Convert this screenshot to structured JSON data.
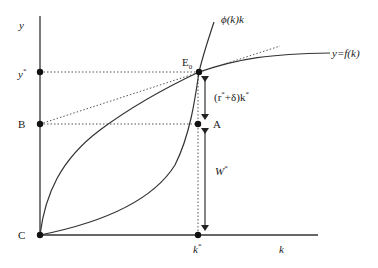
{
  "figure": {
    "type": "economics-diagram",
    "axes": {
      "y_label": "y",
      "x_label": "k"
    },
    "curves": [
      {
        "name": "production-function",
        "label": "y=f(k)"
      },
      {
        "name": "phi-curve",
        "label": "ϕ(k)k"
      },
      {
        "name": "tangent-line",
        "style": "dotted"
      }
    ],
    "points": {
      "origin": "C",
      "b": "B",
      "y_star": "y",
      "y_star_sup": "*",
      "e0": "E",
      "e0_sub": "0",
      "a": "A",
      "k_star": "k",
      "k_star_sup": "*"
    },
    "annotations": {
      "depreciation_prefix": "(r",
      "depreciation_sup1": "*",
      "depreciation_mid": "+δ)k",
      "depreciation_sup2": "*",
      "wage": "W",
      "wage_sup": "*"
    },
    "colors": {
      "line": "#222222",
      "dotted": "#555555",
      "background": "#ffffff"
    }
  }
}
